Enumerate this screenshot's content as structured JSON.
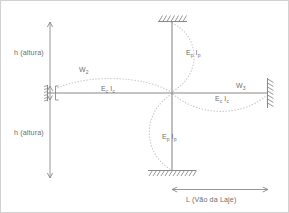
{
  "diagram": {
    "colors": {
      "line": "#7d7d7d",
      "text": "#6f6f6f",
      "dotted": "#c4c4c4",
      "border": "#cfcfcf",
      "background": "#ffffff"
    },
    "labels": {
      "height_top": "h (altura)",
      "height_bottom": "h (altura)",
      "span": "L (Vão da Laje)",
      "load_left": "W",
      "load_left_sub": "2",
      "load_right": "W",
      "load_right_sub": "3",
      "stiff_beam_left": "E",
      "stiff_beam_left_sub1": "c",
      "stiff_beam_left_i": "I",
      "stiff_beam_left_sub2": "c",
      "stiff_beam_right": "E",
      "stiff_beam_right_sub1": "c",
      "stiff_beam_right_i": "I",
      "stiff_beam_right_sub2": "c",
      "stiff_col_top": "E",
      "stiff_col_top_sub1": "p",
      "stiff_col_top_i": "I",
      "stiff_col_top_sub2": "p",
      "stiff_col_bottom": "E",
      "stiff_col_bottom_sub1": "p",
      "stiff_col_bottom_i": "I",
      "stiff_col_bottom_sub2": "p"
    },
    "supports": {
      "top": "fixed-support-hatched",
      "bottom": "fixed-support-hatched",
      "right": "fixed-support-hatched",
      "left": "pinned-support-hatched"
    },
    "geometry": {
      "joint_x": 172,
      "joint_y": 93,
      "column_top_y": 22,
      "column_bottom_y": 170,
      "beam_left_x": 48,
      "beam_right_x": 268,
      "dim_line_x": 50,
      "dim_top_y": 22,
      "dim_bottom_y": 178,
      "span_dim_y": 190
    }
  }
}
